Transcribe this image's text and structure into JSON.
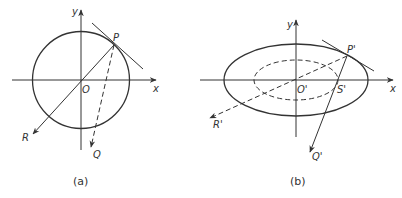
{
  "figure_a": {
    "caption": "(a)",
    "labels": {
      "y_axis": "y",
      "x_axis": "x",
      "origin": "O",
      "point_p": "P",
      "point_r": "R",
      "point_q": "Q"
    },
    "shape": "circle"
  },
  "figure_b": {
    "caption": "(b)",
    "labels": {
      "y_axis": "y",
      "x_axis": "x",
      "origin": "O'",
      "point_p": "P'",
      "point_s": "S'",
      "point_r": "R'",
      "point_q": "Q'"
    },
    "shape": "ellipse"
  },
  "colors": {
    "stroke": "#333333",
    "background": "#ffffff"
  }
}
